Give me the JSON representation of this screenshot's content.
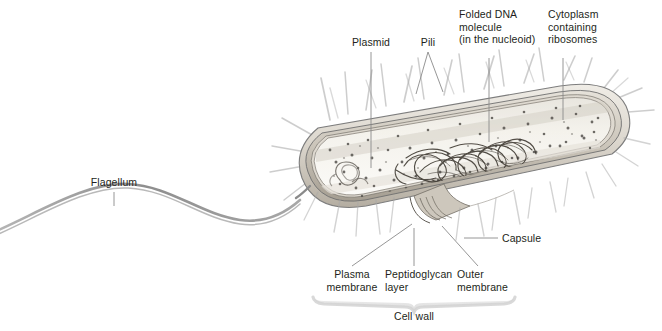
{
  "figure": {
    "background_color": "#ffffff",
    "text_color": "#231f20",
    "width": 662,
    "height": 331
  },
  "labels": {
    "plasmid": "Plasmid",
    "pili": "Pili",
    "folded_dna": "Folded DNA\nmolecule\n(in the nucleoid)",
    "cytoplasm": "Cytoplasm\ncontaining\nribosomes",
    "flagellum": "Flagellum",
    "capsule": "Capsule",
    "plasma_membrane": "Plasma\nmembrane",
    "peptidoglycan_layer": "Peptidoglycan\nlayer",
    "outer_membrane": "Outer\nmembrane",
    "cell_wall": "Cell wall"
  },
  "colors": {
    "outline": "#6e6e6e",
    "wall_light": "#d8d4cc",
    "wall_mid": "#b9b3a9",
    "wall_dark": "#8d867b",
    "cytoplasm": "#f1efe9",
    "ribosome": "#5a5a5a",
    "dna": "#4a463f",
    "pili": "#9a9a9a",
    "bracket": "#e2e2e2",
    "leader": "#8a8a8a"
  }
}
